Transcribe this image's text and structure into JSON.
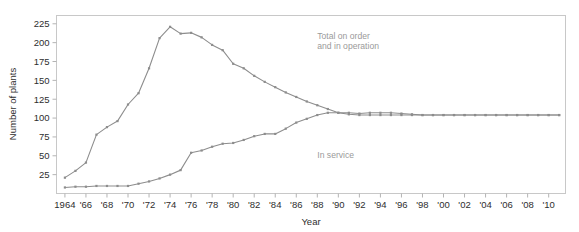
{
  "chart_data": {
    "type": "line",
    "title": "",
    "xlabel": "Year",
    "ylabel": "Number of plants",
    "xlim": [
      1963.2,
      2011.6
    ],
    "ylim": [
      0,
      236
    ],
    "grid": false,
    "legend_position": "in-plot-annotations",
    "ytick_values": [
      25,
      50,
      75,
      100,
      125,
      150,
      175,
      200,
      225
    ],
    "ytick_labels": [
      "25",
      "50",
      "75",
      "100",
      "125",
      "150",
      "175",
      "200",
      "225"
    ],
    "xtick_values": [
      1964,
      1966,
      1968,
      1970,
      1972,
      1974,
      1976,
      1978,
      1980,
      1982,
      1984,
      1986,
      1988,
      1990,
      1992,
      1994,
      1996,
      1998,
      2000,
      2002,
      2004,
      2006,
      2008,
      2010
    ],
    "xtick_labels": [
      "1964",
      "'66",
      "'68",
      "'70",
      "'72",
      "'74",
      "'76",
      "'78",
      "'80",
      "'82",
      "'84",
      "'86",
      "'88",
      "'90",
      "'92",
      "'94",
      "'96",
      "'98",
      "'00",
      "'02",
      "'04",
      "'06",
      "'08",
      "'10"
    ],
    "x": [
      1964,
      1965,
      1966,
      1967,
      1968,
      1969,
      1970,
      1971,
      1972,
      1973,
      1974,
      1975,
      1976,
      1977,
      1978,
      1979,
      1980,
      1981,
      1982,
      1983,
      1984,
      1985,
      1986,
      1987,
      1988,
      1989,
      1990,
      1991,
      1992,
      1993,
      1994,
      1995,
      1996,
      1997,
      1998,
      1999,
      2000,
      2001,
      2002,
      2003,
      2004,
      2005,
      2006,
      2007,
      2008,
      2009,
      2010,
      2011
    ],
    "series": [
      {
        "name": "Total on order and in operation",
        "label_lines": [
          "Total on order",
          "and in operation"
        ],
        "label_x": 1988,
        "label_y": 205,
        "color": "#8d8d8d",
        "values": [
          21,
          30,
          41,
          78,
          88,
          96,
          118,
          133,
          166,
          206,
          221,
          212,
          213,
          207,
          197,
          190,
          172,
          166,
          156,
          148,
          141,
          134,
          128,
          122,
          117,
          112,
          107,
          105,
          104,
          104,
          104,
          104,
          104,
          104,
          104,
          104,
          104,
          104,
          104,
          104,
          104,
          104,
          104,
          104,
          104,
          104,
          104,
          104
        ]
      },
      {
        "name": "In service",
        "label_lines": [
          "In service"
        ],
        "label_x": 1988,
        "label_y": 47,
        "color": "#8d8d8d",
        "values": [
          8,
          9,
          9,
          10,
          10,
          10,
          10,
          13,
          16,
          20,
          25,
          31,
          54,
          57,
          62,
          66,
          67,
          71,
          76,
          79,
          79,
          86,
          94,
          99,
          104,
          107,
          107,
          107,
          106,
          107,
          107,
          107,
          106,
          105,
          104,
          104,
          104,
          104,
          104,
          104,
          104,
          104,
          104,
          104,
          104,
          104,
          104,
          104
        ]
      }
    ]
  },
  "figure": {
    "background_color": "#ffffff",
    "axis_color": "#c8c8c8",
    "text_color": "#2e2e2e",
    "annotation_color": "#9a9a9a"
  }
}
